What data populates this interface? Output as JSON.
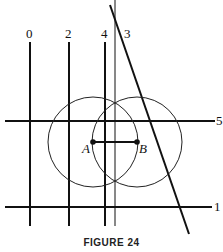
{
  "figure": {
    "caption": "FIGURE 24",
    "line_color": "#111111",
    "vertical_labels": [
      "0",
      "2",
      "4",
      "3"
    ],
    "horizontal_labels": [
      "5",
      "1"
    ],
    "points": [
      {
        "label": "A"
      },
      {
        "label": "B"
      }
    ]
  }
}
